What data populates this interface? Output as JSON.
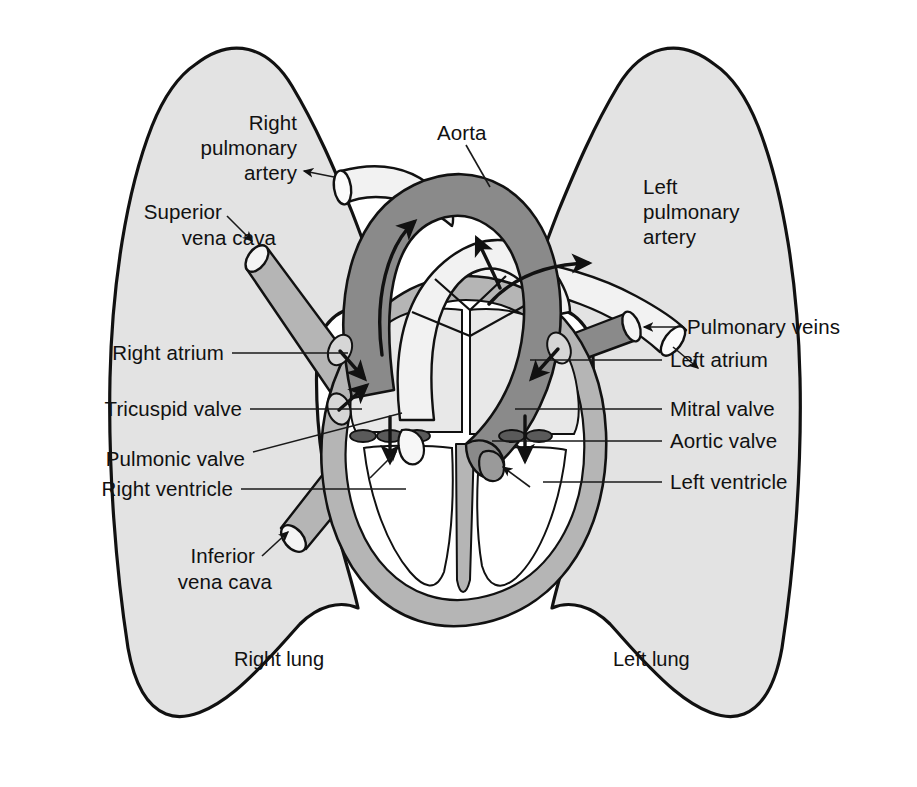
{
  "figure": {
    "type": "anatomy-diagram"
  },
  "colors": {
    "background": "#ffffff",
    "lung_fill": "#e3e3e3",
    "lung_stroke": "#111111",
    "myocardium_fill": "#b5b5b5",
    "chamber_fill": "#ffffff",
    "atrium_fill": "#e8e8e8",
    "aorta_fill": "#8a8a8a",
    "vein_dark_fill": "#8a8a8a",
    "vena_cava_fill": "#b5b5b5",
    "pulmonary_trunk_fill": "#f2f2f2",
    "pulmonary_artery_fill": "#f2f2f2",
    "valve_fill": "#5a5a5a",
    "arrow_color": "#111111",
    "text_color": "#111111"
  },
  "labels": {
    "right_pulmonary_artery": {
      "lines": [
        "Right",
        "pulmonary",
        "artery"
      ],
      "line1": "Right",
      "line2": "pulmonary",
      "line3": "artery",
      "align": "right",
      "connector": "arrow"
    },
    "superior_vena_cava": {
      "lines": [
        "Superior",
        "vena cava"
      ],
      "line1": "Superior",
      "line2": "vena cava",
      "align": "right",
      "connector": "arrow"
    },
    "aorta": {
      "text": "Aorta",
      "align": "left",
      "connector": "line"
    },
    "left_pulmonary_artery": {
      "lines": [
        "Left",
        "pulmonary",
        "artery"
      ],
      "line1": "Left",
      "line2": "pulmonary",
      "line3": "artery",
      "align": "left",
      "connector": "arrow"
    },
    "pulmonary_veins": {
      "text": "Pulmonary veins",
      "align": "left",
      "connector": "arrow"
    },
    "right_atrium": {
      "text": "Right atrium",
      "align": "right",
      "connector": "line"
    },
    "left_atrium": {
      "text": "Left atrium",
      "align": "left",
      "connector": "line"
    },
    "tricuspid_valve": {
      "text": "Tricuspid valve",
      "align": "right",
      "connector": "line"
    },
    "mitral_valve": {
      "text": "Mitral valve",
      "align": "left",
      "connector": "line"
    },
    "pulmonic_valve": {
      "text": "Pulmonic valve",
      "align": "right",
      "connector": "line"
    },
    "aortic_valve": {
      "text": "Aortic valve",
      "align": "left",
      "connector": "line"
    },
    "right_ventricle": {
      "text": "Right ventricle",
      "align": "right",
      "connector": "line"
    },
    "left_ventricle": {
      "text": "Left ventricle",
      "align": "left",
      "connector": "line"
    },
    "inferior_vena_cava": {
      "lines": [
        "Inferior",
        "vena cava"
      ],
      "line1": "Inferior",
      "line2": "vena cava",
      "align": "right",
      "connector": "arrow"
    },
    "right_lung": {
      "text": "Right lung",
      "align": "center",
      "connector": "none"
    },
    "left_lung": {
      "text": "Left lung",
      "align": "center",
      "connector": "none"
    }
  },
  "structures": {
    "right_lung": "right-lung-shape",
    "left_lung": "left-lung-shape",
    "heart_wall": "myocardium-shape",
    "aortic_arch": "aorta-shape",
    "pulmonary_trunk": "pulmonary-trunk-shape",
    "superior_vena_cava": "svc-tube",
    "inferior_vena_cava": "ivc-tube",
    "right_pulmonary_artery": "rpa-tube",
    "left_pulmonary_artery": "lpa-tube",
    "pulmonary_veins": "pulmonary-veins-tube",
    "right_atrium": "right-atrium-chamber",
    "left_atrium": "left-atrium-chamber",
    "right_ventricle": "right-ventricle-chamber",
    "left_ventricle": "left-ventricle-chamber",
    "tricuspid_valve": "tricuspid-valve-leaflets",
    "mitral_valve": "mitral-valve-leaflets",
    "pulmonic_valve": "pulmonic-valve-cusp",
    "aortic_valve": "aortic-valve-cusp"
  },
  "flow_arrows": [
    {
      "name": "aorta-flow-arrow",
      "direction": "up-left-around-arch"
    },
    {
      "name": "pulmonary-trunk-flow-arrow",
      "direction": "up"
    },
    {
      "name": "left-pulmonary-artery-flow-arrow",
      "direction": "right"
    },
    {
      "name": "right-atrium-inflow-arrow-superior",
      "direction": "down-right"
    },
    {
      "name": "right-atrium-inflow-arrow-inferior",
      "direction": "up-right"
    },
    {
      "name": "left-atrium-inflow-arrow",
      "direction": "down-left"
    },
    {
      "name": "tricuspid-flow-arrow",
      "direction": "down"
    },
    {
      "name": "mitral-flow-arrow",
      "direction": "down"
    }
  ]
}
